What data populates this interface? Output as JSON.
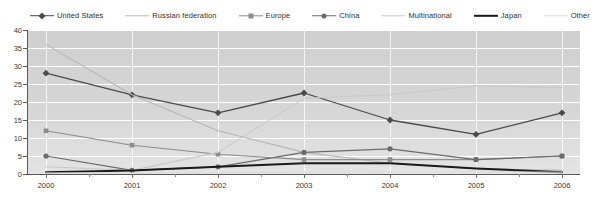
{
  "chart_data": {
    "type": "line",
    "title": "Number of nuclear events",
    "xlabel": "",
    "ylabel": "",
    "x": [
      2000,
      2001,
      2002,
      2003,
      2004,
      2005,
      2006
    ],
    "categories": [
      "2000",
      "2001",
      "2002",
      "2003",
      "2004",
      "2005",
      "2006"
    ],
    "ylim": [
      0,
      40
    ],
    "yticks": [
      0,
      5,
      10,
      15,
      20,
      25,
      30,
      35,
      40
    ],
    "ytick_labels": [
      "0",
      "5",
      "10",
      "15",
      "20",
      "25",
      "30",
      "35",
      "40"
    ],
    "grid": "horizontal-and-vertical-white",
    "legend_position": "top",
    "plot_background": "#d3d3d3",
    "series": [
      {
        "name": "United States",
        "values": [
          28,
          22,
          17,
          22.5,
          15,
          11,
          17
        ],
        "color": "#4a4a4a",
        "marker": "diamond",
        "width": 1.3
      },
      {
        "name": "Russian federation",
        "values": [
          36,
          22,
          12,
          6,
          3,
          1.5,
          1
        ],
        "color": "#b7b7b7",
        "marker": "none",
        "width": 1.1
      },
      {
        "name": "Europe",
        "values": [
          12,
          8,
          5.5,
          4,
          4,
          4,
          5
        ],
        "color": "#8d8d8d",
        "marker": "square",
        "width": 1.1
      },
      {
        "name": "China",
        "values": [
          5,
          1,
          2,
          6,
          7,
          4,
          5
        ],
        "color": "#6b6b6b",
        "marker": "circle",
        "width": 1.2
      },
      {
        "name": "Multinational",
        "values": [
          2,
          1,
          6,
          21,
          22,
          24.5,
          24
        ],
        "color": "#c9c9c9",
        "marker": "none",
        "width": 1.1
      },
      {
        "name": "Japan",
        "values": [
          0.5,
          1,
          2,
          3,
          3,
          1.5,
          0.5
        ],
        "color": "#1a1a1a",
        "marker": "none",
        "width": 2.0
      },
      {
        "name": "Other",
        "values": [
          0.3,
          0.3,
          0.4,
          0.5,
          0.6,
          0.6,
          0.5
        ],
        "color": "#dcdcdc",
        "marker": "none",
        "width": 1.0
      }
    ]
  },
  "legend": {
    "items": [
      {
        "label": "United States",
        "color": "#4a4a4a",
        "marker": "diamond",
        "width": 1.6
      },
      {
        "label": "Russian federation",
        "color": "#b7b7b7",
        "marker": "none",
        "width": 1.4
      },
      {
        "label": "Europe",
        "color": "#8d8d8d",
        "marker": "square",
        "width": 1.4
      },
      {
        "label": "China",
        "color": "#6b6b6b",
        "marker": "circle",
        "width": 1.5
      },
      {
        "label": "Multinational",
        "color": "#c9c9c9",
        "marker": "none",
        "width": 1.4
      },
      {
        "label": "Japan",
        "color": "#1a1a1a",
        "marker": "none",
        "width": 2.4
      },
      {
        "label": "Other",
        "color": "#dcdcdc",
        "marker": "none",
        "width": 1.3
      }
    ]
  }
}
